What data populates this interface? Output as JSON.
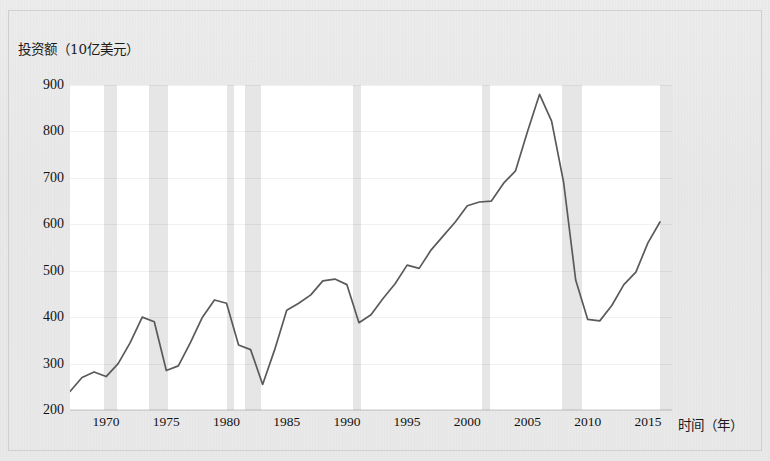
{
  "figure": {
    "y_axis_caption": "投资额（10亿美元）",
    "x_axis_caption": "时间（年）"
  },
  "chart_data": {
    "type": "line",
    "title": "",
    "subtitle": "",
    "xlabel": "时间（年）",
    "ylabel": "投资额（10亿美元）",
    "xlim": [
      1967,
      1000
    ],
    "x_range": [
      1967,
      2017
    ],
    "ylim": [
      200,
      900
    ],
    "y_ticks": [
      900,
      800,
      700,
      600,
      500,
      400,
      300,
      200
    ],
    "x_ticks": [
      1970,
      1975,
      1980,
      1985,
      1990,
      1995,
      2000,
      2005,
      2010,
      2015
    ],
    "grid": true,
    "legend": "none",
    "line_color": "#5a5a5a",
    "band_color": "#e6e6e6",
    "plot_background": "#ffffff",
    "series": [
      {
        "name": "投资额",
        "x": [
          1967,
          1968,
          1969,
          1970,
          1971,
          1972,
          1973,
          1974,
          1975,
          1976,
          1977,
          1978,
          1979,
          1980,
          1981,
          1982,
          1983,
          1984,
          1985,
          1986,
          1987,
          1988,
          1989,
          1990,
          1991,
          1992,
          1993,
          1994,
          1995,
          1996,
          1997,
          1998,
          1999,
          2000,
          2001,
          2002,
          2003,
          2004,
          2005,
          2006,
          2007,
          2008,
          2009,
          2010,
          2011,
          2012,
          2013,
          2014,
          2015,
          2016
        ],
        "values": [
          240,
          270,
          282,
          272,
          300,
          345,
          400,
          390,
          285,
          295,
          345,
          400,
          437,
          430,
          340,
          330,
          255,
          330,
          415,
          430,
          448,
          478,
          482,
          470,
          388,
          405,
          440,
          472,
          512,
          505,
          545,
          575,
          605,
          640,
          648,
          650,
          688,
          715,
          800,
          880,
          822,
          690,
          480,
          395,
          392,
          425,
          470,
          497,
          560,
          605
        ]
      }
    ],
    "recession_bands": [
      {
        "start": 1969.8,
        "end": 1970.9
      },
      {
        "start": 1973.6,
        "end": 1975.1
      },
      {
        "start": 1980.0,
        "end": 1980.6
      },
      {
        "start": 1981.5,
        "end": 1982.9
      },
      {
        "start": 1990.5,
        "end": 1991.2
      },
      {
        "start": 2001.2,
        "end": 2001.9
      },
      {
        "start": 2007.9,
        "end": 2009.5
      },
      {
        "start": 2016.0,
        "end": 2017.0
      }
    ]
  }
}
